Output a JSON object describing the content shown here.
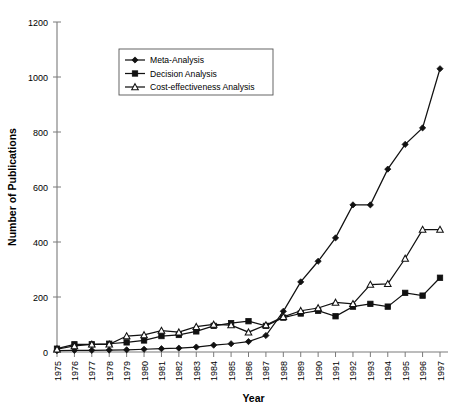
{
  "chart_data": {
    "type": "line",
    "title": "",
    "xlabel": "Year",
    "ylabel": "Number of Publications",
    "grid": false,
    "legend_position": "top-center-left",
    "xlim": [
      1975,
      1997
    ],
    "ylim": [
      0,
      1200
    ],
    "ytick_step": 200,
    "categories": [
      1975,
      1976,
      1977,
      1978,
      1979,
      1980,
      1981,
      1982,
      1983,
      1984,
      1985,
      1986,
      1987,
      1988,
      1989,
      1990,
      1991,
      1992,
      1993,
      1994,
      1995,
      1996,
      1997
    ],
    "xtick_labels": [
      "1975",
      "1976",
      "1977",
      "1978",
      "1979",
      "1980",
      "1981",
      "1982",
      "1983",
      "1984",
      "1985",
      "1986",
      "1987",
      "1988",
      "1989",
      "1990",
      "1991",
      "1992",
      "1993",
      "1994",
      "1995",
      "1996",
      "1997"
    ],
    "ytick_labels": [
      "0",
      "200",
      "400",
      "600",
      "800",
      "1000",
      "1200"
    ],
    "ytick_values": [
      0,
      200,
      400,
      600,
      800,
      1000,
      1200
    ],
    "series": [
      {
        "name": "Meta-Analysis",
        "marker": "filled-diamond",
        "values": [
          5,
          6,
          6,
          7,
          8,
          10,
          12,
          14,
          18,
          25,
          30,
          38,
          60,
          148,
          255,
          330,
          415,
          535,
          535,
          665,
          755,
          815,
          1030
        ]
      },
      {
        "name": "Decision Analysis",
        "marker": "filled-square",
        "values": [
          12,
          28,
          28,
          30,
          35,
          42,
          58,
          62,
          75,
          95,
          105,
          112,
          95,
          125,
          140,
          150,
          130,
          165,
          175,
          165,
          215,
          205,
          270
        ]
      },
      {
        "name": "Cost-effectiveness Analysis",
        "marker": "open-triangle",
        "values": [
          10,
          22,
          28,
          28,
          58,
          62,
          78,
          72,
          92,
          100,
          98,
          72,
          98,
          128,
          150,
          160,
          180,
          175,
          245,
          248,
          340,
          445,
          445
        ]
      }
    ]
  },
  "legend": {
    "entries": [
      {
        "label": "Meta-Analysis"
      },
      {
        "label": "Decision Analysis"
      },
      {
        "label": "Cost-effectiveness Analysis"
      }
    ]
  },
  "axes": {
    "x_title": "Year",
    "y_title": "Number of Publications"
  }
}
